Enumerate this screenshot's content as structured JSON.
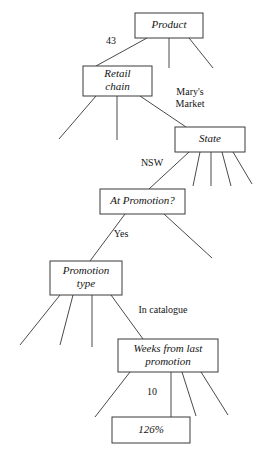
{
  "diagram": {
    "type": "decision-tree",
    "canvas": {
      "width": 268,
      "height": 462
    },
    "style": {
      "box_fill": "#ffffff",
      "box_stroke": "#3a3a3a",
      "edge_stroke": "#4a4a4a",
      "text_color": "#141414",
      "background": "#ffffff"
    },
    "nodes": [
      {
        "id": "product",
        "label": "Product",
        "lines": [
          "Product"
        ],
        "x": 135,
        "y": 13,
        "w": 68,
        "h": 25
      },
      {
        "id": "retail-chain",
        "label": "Retail chain",
        "lines": [
          "Retail",
          "chain"
        ],
        "x": 83,
        "y": 66,
        "w": 69,
        "h": 30
      },
      {
        "id": "state",
        "label": "State",
        "lines": [
          "State"
        ],
        "x": 175,
        "y": 127,
        "w": 70,
        "h": 25
      },
      {
        "id": "at-promotion",
        "label": "At Promotion?",
        "lines": [
          "At Promotion?"
        ],
        "x": 100,
        "y": 189,
        "w": 85,
        "h": 25
      },
      {
        "id": "promotion-type",
        "label": "Promotion type",
        "lines": [
          "Promotion",
          "type"
        ],
        "x": 50,
        "y": 261,
        "w": 72,
        "h": 34
      },
      {
        "id": "weeks-from-last-promotion",
        "label": "Weeks from last promotion",
        "lines": [
          "Weeks from last",
          "promotion"
        ],
        "x": 118,
        "y": 339,
        "w": 100,
        "h": 33
      },
      {
        "id": "result",
        "label": "126%",
        "lines": [
          "126%"
        ],
        "x": 112,
        "y": 417,
        "w": 78,
        "h": 26
      }
    ],
    "edges": [
      {
        "id": "product-to-retail-chain",
        "from": "product",
        "to": "retail-chain",
        "x1": 147,
        "y1": 38,
        "x2": 96,
        "y2": 66,
        "label": "43"
      },
      {
        "id": "product-branch-middle",
        "from": "product",
        "to": null,
        "x1": 169,
        "y1": 38,
        "x2": 169,
        "y2": 68,
        "label": ""
      },
      {
        "id": "product-branch-right",
        "from": "product",
        "to": null,
        "x1": 189,
        "y1": 38,
        "x2": 213,
        "y2": 68,
        "label": ""
      },
      {
        "id": "retail-chain-branch-left",
        "from": "retail-chain",
        "to": null,
        "x1": 96,
        "y1": 96,
        "x2": 59,
        "y2": 139,
        "label": ""
      },
      {
        "id": "retail-chain-branch-middle",
        "from": "retail-chain",
        "to": null,
        "x1": 117,
        "y1": 96,
        "x2": 117,
        "y2": 140,
        "label": ""
      },
      {
        "id": "retail-chain-to-state",
        "from": "retail-chain",
        "to": "state",
        "x1": 140,
        "y1": 96,
        "x2": 186,
        "y2": 127,
        "label": "Mary's Market"
      },
      {
        "id": "state-to-at-promotion",
        "from": "state",
        "to": "at-promotion",
        "x1": 189,
        "y1": 152,
        "x2": 149,
        "y2": 189,
        "label": "NSW"
      },
      {
        "id": "state-branch-2",
        "from": "state",
        "to": null,
        "x1": 200,
        "y1": 152,
        "x2": 193,
        "y2": 186,
        "label": ""
      },
      {
        "id": "state-branch-3",
        "from": "state",
        "to": null,
        "x1": 211,
        "y1": 152,
        "x2": 211,
        "y2": 186,
        "label": ""
      },
      {
        "id": "state-branch-4",
        "from": "state",
        "to": null,
        "x1": 222,
        "y1": 152,
        "x2": 231,
        "y2": 186,
        "label": ""
      },
      {
        "id": "state-branch-5",
        "from": "state",
        "to": null,
        "x1": 233,
        "y1": 152,
        "x2": 252,
        "y2": 184,
        "label": ""
      },
      {
        "id": "at-promotion-to-promotion-type",
        "from": "at-promotion",
        "to": "promotion-type",
        "x1": 125,
        "y1": 214,
        "x2": 90,
        "y2": 261,
        "label": "Yes"
      },
      {
        "id": "at-promotion-branch-right",
        "from": "at-promotion",
        "to": null,
        "x1": 164,
        "y1": 214,
        "x2": 212,
        "y2": 258,
        "label": ""
      },
      {
        "id": "promotion-type-branch-1",
        "from": "promotion-type",
        "to": null,
        "x1": 60,
        "y1": 295,
        "x2": 20,
        "y2": 345,
        "label": ""
      },
      {
        "id": "promotion-type-branch-2",
        "from": "promotion-type",
        "to": null,
        "x1": 73,
        "y1": 295,
        "x2": 60,
        "y2": 345,
        "label": ""
      },
      {
        "id": "promotion-type-branch-3",
        "from": "promotion-type",
        "to": null,
        "x1": 92,
        "y1": 295,
        "x2": 92,
        "y2": 347,
        "label": ""
      },
      {
        "id": "promotion-type-to-weeks",
        "from": "promotion-type",
        "to": "weeks-from-last-promotion",
        "x1": 111,
        "y1": 295,
        "x2": 143,
        "y2": 339,
        "label": "In catalogue"
      },
      {
        "id": "weeks-branch-left",
        "from": "weeks-from-last-promotion",
        "to": null,
        "x1": 130,
        "y1": 372,
        "x2": 95,
        "y2": 417,
        "label": ""
      },
      {
        "id": "weeks-to-result",
        "from": "weeks-from-last-promotion",
        "to": "result",
        "x1": 171,
        "y1": 372,
        "x2": 171,
        "y2": 417,
        "label": "10"
      },
      {
        "id": "weeks-branch-3",
        "from": "weeks-from-last-promotion",
        "to": null,
        "x1": 182,
        "y1": 372,
        "x2": 196,
        "y2": 416,
        "label": ""
      },
      {
        "id": "weeks-branch-4",
        "from": "weeks-from-last-promotion",
        "to": null,
        "x1": 201,
        "y1": 372,
        "x2": 228,
        "y2": 415,
        "label": ""
      }
    ],
    "edge_labels": [
      {
        "id": "label-43",
        "text": "43",
        "x": 111,
        "y": 42,
        "lines": [
          "43"
        ]
      },
      {
        "id": "label-marys-market",
        "text": "Mary's Market",
        "x": 190,
        "y": 99,
        "lines": [
          "Mary's",
          "Market"
        ]
      },
      {
        "id": "label-nsw",
        "text": "NSW",
        "x": 152,
        "y": 164,
        "lines": [
          "NSW"
        ]
      },
      {
        "id": "label-yes",
        "text": "Yes",
        "x": 121,
        "y": 235,
        "lines": [
          "Yes"
        ]
      },
      {
        "id": "label-in-catalogue",
        "text": "In catalogue",
        "x": 163,
        "y": 311,
        "lines": [
          "In catalogue"
        ]
      },
      {
        "id": "label-10",
        "text": "10",
        "x": 152,
        "y": 393,
        "lines": [
          "10"
        ]
      }
    ]
  }
}
